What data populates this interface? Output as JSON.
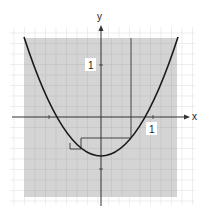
{
  "diagram": {
    "type": "function-graph",
    "axes": {
      "x_label": "x",
      "y_label": "y"
    },
    "unit_labels": {
      "x_unit": "1",
      "y_unit": "1"
    },
    "curve": {
      "kind": "parabola",
      "description": "upward parabola with vertex below origin"
    },
    "colors": {
      "shaded_region": "#d4d4d4",
      "grid": "#b8b8b8",
      "curve": "#1a1a1a",
      "axis": "#333333"
    }
  }
}
